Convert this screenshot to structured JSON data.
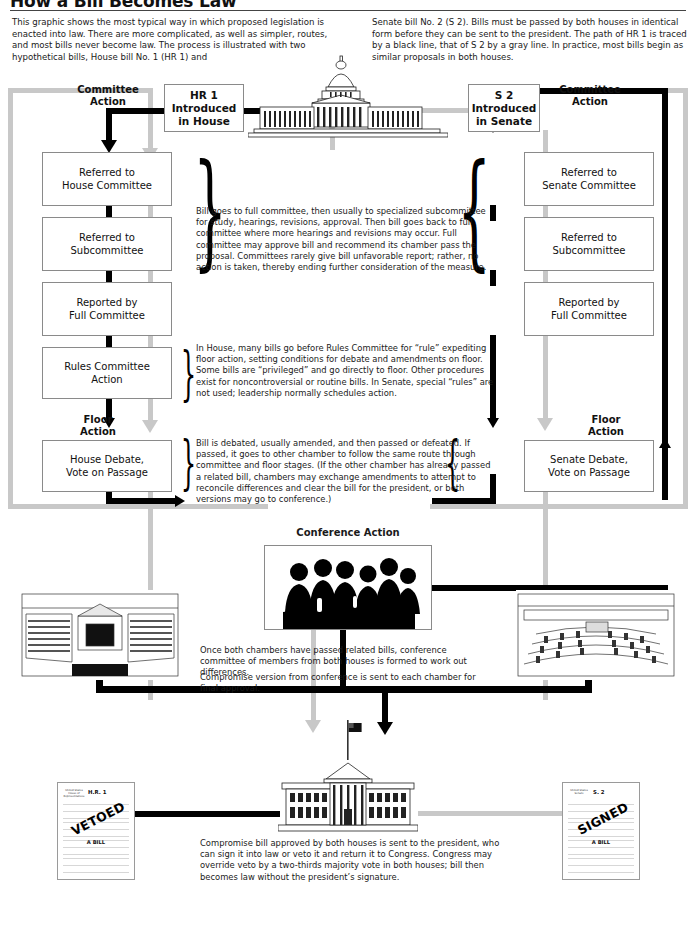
{
  "header": {
    "title": "How a Bill Becomes Law",
    "intro_left": "This graphic shows the most typical way in which proposed legislation is enacted into law. There are more complicated, as well as simpler, routes, and most bills never become law. The process is illustrated with two hypothetical bills, House bill No. 1 (HR 1) and",
    "intro_right": "Senate bill No. 2 (S 2). Bills must be passed by both houses in identical form before they can be sent to the president. The path of HR 1 is traced by a black line, that of S 2 by a gray line. In practice, most bills begin as similar proposals in both houses."
  },
  "house": {
    "intro_box": "HR 1\nIntroduced\nin House",
    "committee_action_label": "Committee\nAction",
    "floor_action_label": "Floor\nAction",
    "steps": [
      "Referred to\nHouse Committee",
      "Referred to\nSubcommittee",
      "Reported by\nFull Committee",
      "Rules Committee\nAction",
      "House Debate,\nVote on Passage"
    ]
  },
  "senate": {
    "intro_box": "S 2\nIntroduced\nin Senate",
    "committee_action_label": "Committee\nAction",
    "floor_action_label": "Floor\nAction",
    "steps": [
      "Referred to\nSenate Committee",
      "Referred to\nSubcommittee",
      "Reported by\nFull Committee",
      "Senate Debate,\nVote on Passage"
    ]
  },
  "annotations": {
    "committee": "Bill goes to full committee, then usually to specialized subcommittee for study, hearings, revisions, approval. Then bill goes back to full committee where more hearings and revisions may occur. Full committee may approve bill and recommend its chamber pass the proposal. Committees rarely give bill unfavorable report; rather, no action is taken, thereby ending further consideration of the measure.",
    "rules": "In House, many bills go before Rules Committee for “rule” expediting floor action, setting conditions for debate and amendments on floor. Some bills are “privileged” and go directly to floor. Other procedures exist for noncontroversial or routine bills. In Senate, special “rules” are not used; leadership normally schedules action.",
    "floor": "Bill is debated, usually amended, and then passed or defeated. If passed, it goes to other chamber to follow the same route through committee and floor stages. (If the other chamber has already passed a related bill, chambers may exchange amendments to attempt to reconcile differences and clear the bill for the president, or both versions may go to conference.)",
    "conference_1": "Once both chambers have passed related bills, conference committee of members from both houses is formed to work out differences.",
    "conference_2": "Compromise version from conference is sent to each chamber for final approval.",
    "president": "Compromise bill approved by both houses is sent to the president, who can sign it into law or veto it and return it to Congress. Congress may override veto by a two-thirds majority vote in both houses; bill then becomes law without the president’s signature."
  },
  "conference": {
    "caption": "Conference Action"
  },
  "bills": {
    "vetoed": {
      "seal": "United States\nHouse of Representatives",
      "number": "H.R. 1",
      "stamp": "VETOED",
      "subtitle": "A BILL"
    },
    "signed": {
      "seal": "United States\nSenate",
      "number": "S. 2",
      "stamp": "SIGNED",
      "subtitle": "A BILL"
    }
  },
  "colors": {
    "hr1_path": "#000000",
    "s2_path": "#c8c8c8",
    "box_border": "#8a8a8a",
    "text": "#1a1a1a"
  }
}
